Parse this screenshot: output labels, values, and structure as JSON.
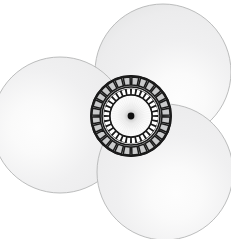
{
  "figure": {
    "canvas": {
      "width": 231,
      "height": 239,
      "background": "#ffffff"
    },
    "colors": {
      "sphere_fill_light": "#fdfdfd",
      "sphere_fill_mid": "#ececed",
      "sphere_fill_dark": "#d7d8d8",
      "sphere_outline": "#b4b5b6",
      "disc_line": "#1a1a1a",
      "disc_segment_fill": "#c9cacb",
      "disc_inner_segment_fill": "#ffffff",
      "disc_core_fill": "#fbfbfb",
      "center_dot": "#101010"
    },
    "spheres": [
      {
        "name": "top-right-sphere",
        "label": "anion sphere top right",
        "cx": 163,
        "cy": 72,
        "r": 68,
        "highlight_x": 0.62,
        "highlight_y": 0.7
      },
      {
        "name": "left-sphere",
        "label": "anion sphere left",
        "cx": 60,
        "cy": 125,
        "r": 68,
        "highlight_x": 0.33,
        "highlight_y": 0.52
      },
      {
        "name": "bottom-right-sphere",
        "label": "anion sphere bottom right",
        "cx": 165,
        "cy": 172,
        "r": 68,
        "highlight_x": 0.58,
        "highlight_y": 0.66
      }
    ],
    "disc": {
      "name": "central-cation-disc",
      "label": "central segmented cation disc",
      "cx": 131,
      "cy": 116,
      "outer_radius": 40,
      "outer_ring_inner_radius": 30.5,
      "middle_radius": 29,
      "inner_ring_outer_radius": 27.5,
      "inner_ring_inner_radius": 21.5,
      "core_radius": 21,
      "outer_segment_count": 28,
      "inner_segment_count": 32,
      "outer_segment_gap_deg": 2.6,
      "inner_segment_gap_deg": 4.2,
      "center_dot_radius": 3.4
    }
  }
}
